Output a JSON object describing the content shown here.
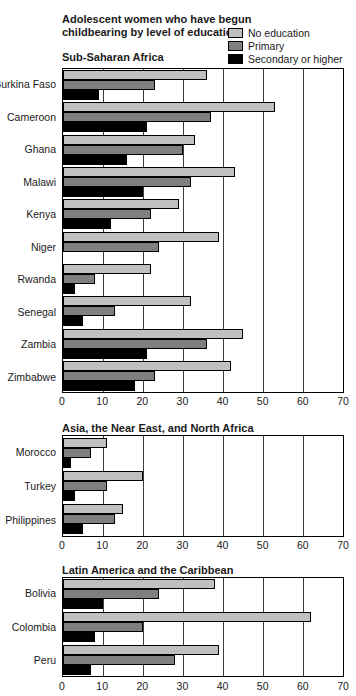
{
  "title": "Adolescent women who have begun\nchildbearing by level of education",
  "legend": {
    "items": [
      {
        "label": "No education",
        "color": "#c0c0c0"
      },
      {
        "label": "Primary",
        "color": "#7f7f7f"
      },
      {
        "label": "Secondary or higher",
        "color": "#000000"
      }
    ]
  },
  "axis": {
    "min": 0,
    "max": 70,
    "ticks": [
      0,
      10,
      20,
      30,
      40,
      50,
      60,
      70
    ]
  },
  "chart_data": [
    {
      "type": "bar",
      "orientation": "horizontal",
      "title": "Sub-Saharan Africa",
      "xlim": [
        0,
        70
      ],
      "grid": true,
      "categories": [
        "Burkina Faso",
        "Cameroon",
        "Ghana",
        "Malawi",
        "Kenya",
        "Niger",
        "Rwanda",
        "Senegal",
        "Zambia",
        "Zimbabwe"
      ],
      "series": [
        {
          "name": "No education",
          "values": [
            36,
            53,
            33,
            43,
            29,
            39,
            22,
            32,
            45,
            42
          ]
        },
        {
          "name": "Primary",
          "values": [
            23,
            37,
            30,
            32,
            22,
            24,
            8,
            13,
            36,
            23
          ]
        },
        {
          "name": "Secondary or higher",
          "values": [
            9,
            21,
            16,
            20,
            12,
            null,
            3,
            5,
            21,
            18
          ]
        }
      ]
    },
    {
      "type": "bar",
      "orientation": "horizontal",
      "title": "Asia, the Near East, and North Africa",
      "xlim": [
        0,
        70
      ],
      "grid": true,
      "categories": [
        "Morocco",
        "Turkey",
        "Philippines"
      ],
      "series": [
        {
          "name": "No education",
          "values": [
            11,
            20,
            15
          ]
        },
        {
          "name": "Primary",
          "values": [
            7,
            11,
            13
          ]
        },
        {
          "name": "Secondary or higher",
          "values": [
            2,
            3,
            5
          ]
        }
      ]
    },
    {
      "type": "bar",
      "orientation": "horizontal",
      "title": "Latin America and the Caribbean",
      "xlim": [
        0,
        70
      ],
      "grid": true,
      "categories": [
        "Bolivia",
        "Colombia",
        "Peru"
      ],
      "series": [
        {
          "name": "No education",
          "values": [
            38,
            62,
            39
          ]
        },
        {
          "name": "Primary",
          "values": [
            24,
            20,
            28
          ]
        },
        {
          "name": "Secondary or higher",
          "values": [
            10,
            8,
            7
          ]
        }
      ]
    }
  ]
}
